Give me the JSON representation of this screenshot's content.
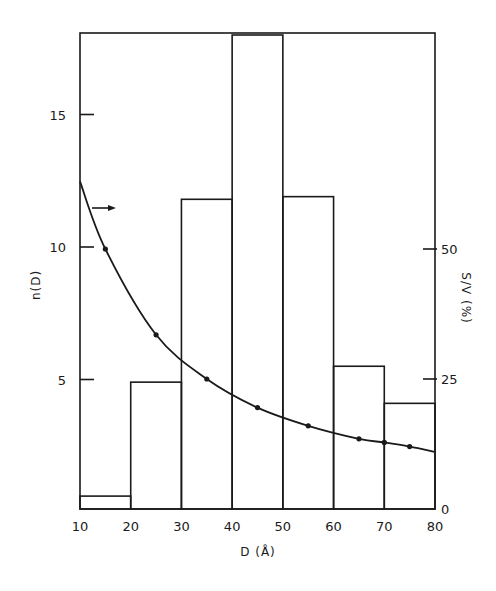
{
  "chart_data": {
    "type": "bar",
    "title": "",
    "xlabel": "D (Å)",
    "ylabel": "n(D)",
    "ylabel_right": "S/V (%)",
    "xlim": [
      10,
      80
    ],
    "ylim": [
      0,
      18
    ],
    "ylim_right": [
      0,
      70
    ],
    "grid": false,
    "x_ticks": [
      10,
      20,
      30,
      40,
      50,
      60,
      70,
      80
    ],
    "y_ticks": [
      5,
      10,
      15
    ],
    "y_ticks_right": [
      0,
      25,
      50
    ],
    "histogram": {
      "name": "n(D)",
      "axis": "left",
      "bins": [
        {
          "from": 10,
          "to": 20,
          "value": 0.6
        },
        {
          "from": 20,
          "to": 30,
          "value": 4.9
        },
        {
          "from": 30,
          "to": 40,
          "value": 11.8
        },
        {
          "from": 40,
          "to": 50,
          "value": 18.0
        },
        {
          "from": 50,
          "to": 60,
          "value": 11.9
        },
        {
          "from": 60,
          "to": 70,
          "value": 5.5
        },
        {
          "from": 70,
          "to": 80,
          "value": 4.1
        }
      ]
    },
    "series": [
      {
        "name": "S/V",
        "type": "line",
        "axis": "right",
        "markers": true,
        "x": [
          15,
          25,
          35,
          45,
          55,
          65,
          70,
          75
        ],
        "values": [
          50,
          33.5,
          25,
          19.5,
          16,
          13.5,
          12.8,
          12
        ]
      }
    ],
    "curve_endpoints": {
      "x_start": 10,
      "y_start": 63,
      "x_end": 80,
      "y_end": 11
    },
    "annotations": [
      {
        "type": "arrow",
        "direction": "right",
        "meaning": "curve refers to right axis (S/V)",
        "x": 12,
        "y_right": 57
      }
    ]
  }
}
